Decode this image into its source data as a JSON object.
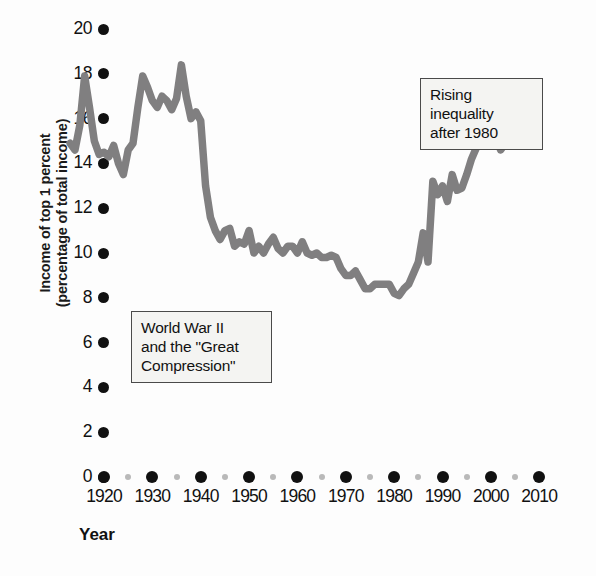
{
  "chart_data": {
    "type": "line",
    "title": "",
    "xlabel": "Year",
    "ylabel_line1": "Income of top 1 percent",
    "ylabel_line2": "(percentage of total income)",
    "xlim": [
      1913,
      2012
    ],
    "ylim": [
      0,
      20
    ],
    "y_ticks": [
      0,
      2,
      4,
      6,
      8,
      10,
      12,
      14,
      16,
      18,
      20
    ],
    "x_ticks": [
      1920,
      1930,
      1940,
      1950,
      1960,
      1970,
      1980,
      1990,
      2000,
      2010
    ],
    "x_minor_ticks": [
      1925,
      1935,
      1945,
      1955,
      1965,
      1975,
      1985,
      1995,
      2005
    ],
    "grid": false,
    "legend": "none",
    "line_color": "#807f80",
    "series": [
      {
        "name": "Income share of top 1 percent",
        "x": [
          1913,
          1914,
          1915,
          1916,
          1917,
          1918,
          1919,
          1920,
          1921,
          1922,
          1923,
          1924,
          1925,
          1926,
          1927,
          1928,
          1929,
          1930,
          1931,
          1932,
          1933,
          1934,
          1935,
          1936,
          1937,
          1938,
          1939,
          1940,
          1941,
          1942,
          1943,
          1944,
          1945,
          1946,
          1947,
          1948,
          1949,
          1950,
          1951,
          1952,
          1953,
          1954,
          1955,
          1956,
          1957,
          1958,
          1959,
          1960,
          1961,
          1962,
          1963,
          1964,
          1965,
          1966,
          1967,
          1968,
          1969,
          1970,
          1971,
          1972,
          1973,
          1974,
          1975,
          1976,
          1977,
          1978,
          1979,
          1980,
          1981,
          1982,
          1983,
          1984,
          1985,
          1986,
          1987,
          1988,
          1989,
          1990,
          1991,
          1992,
          1993,
          1994,
          1995,
          1996,
          1997,
          1998,
          1999,
          2000,
          2001,
          2002,
          2003,
          2004,
          2005,
          2006,
          2007,
          2008,
          2009,
          2010
        ],
        "values": [
          14.9,
          14.6,
          15.7,
          17.9,
          16.5,
          15.0,
          14.4,
          14.5,
          14.3,
          14.8,
          14.0,
          13.5,
          14.6,
          14.9,
          16.5,
          17.9,
          17.4,
          16.8,
          16.5,
          17.0,
          16.8,
          16.4,
          16.9,
          18.4,
          17.0,
          16.0,
          16.3,
          15.9,
          13.0,
          11.6,
          11.0,
          10.6,
          11.0,
          11.1,
          10.3,
          10.5,
          10.4,
          11.0,
          10.0,
          10.3,
          10.0,
          10.4,
          10.7,
          10.2,
          10.0,
          10.3,
          10.3,
          10.0,
          10.5,
          10.0,
          9.9,
          10.0,
          9.8,
          9.8,
          9.9,
          9.8,
          9.3,
          9.0,
          9.0,
          9.2,
          8.8,
          8.4,
          8.4,
          8.6,
          8.6,
          8.6,
          8.6,
          8.2,
          8.1,
          8.4,
          8.6,
          9.1,
          9.6,
          10.9,
          9.6,
          13.2,
          12.6,
          13.0,
          12.3,
          13.5,
          12.8,
          12.9,
          13.5,
          14.2,
          14.7,
          15.0,
          16.0,
          16.5,
          15.3,
          14.6,
          14.9,
          15.6,
          16.4,
          16.9,
          17.0,
          15.6,
          15.0,
          15.0
        ]
      }
    ],
    "annotations": [
      {
        "name": "world-war-2-note",
        "line1": "World War II",
        "line2": "and the \"Great",
        "line3": "Compression\""
      },
      {
        "name": "rising-inequality-note",
        "line1": "Rising",
        "line2": "inequality",
        "line3": "after 1980"
      }
    ]
  }
}
